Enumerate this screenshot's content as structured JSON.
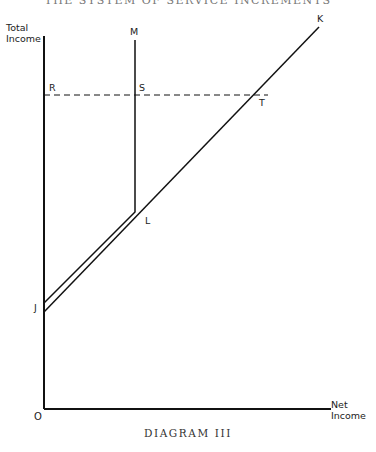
{
  "header": {
    "title": "THE SYSTEM OF SERVICE INCREMENTS"
  },
  "caption": "DIAGRAM III",
  "axes": {
    "y_label_line1": "Total",
    "y_label_line2": "Income",
    "x_label_line1": "Net",
    "x_label_line2": "Income",
    "origin": "O"
  },
  "points": {
    "R": "R",
    "S": "S",
    "T": "T",
    "M": "M",
    "K": "K",
    "L": "L",
    "J": "J"
  }
}
